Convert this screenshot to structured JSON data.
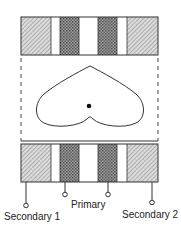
{
  "diagram": {
    "type": "transformer-winding-field-pattern",
    "bars": {
      "top": {
        "x": 21,
        "y": 17,
        "w": 137,
        "h": 38
      },
      "bottom": {
        "x": 21,
        "y": 144,
        "w": 137,
        "h": 38
      },
      "segments": [
        {
          "x0": 21,
          "x1": 51,
          "fill": "light-hatch",
          "role": "secondary"
        },
        {
          "x0": 51,
          "x1": 60,
          "fill": "white",
          "role": "gap"
        },
        {
          "x0": 60,
          "x1": 79,
          "fill": "dark-dots",
          "role": "primary"
        },
        {
          "x0": 79,
          "x1": 98,
          "fill": "white",
          "role": "core"
        },
        {
          "x0": 98,
          "x1": 117,
          "fill": "dark-dots",
          "role": "primary"
        },
        {
          "x0": 117,
          "x1": 127,
          "fill": "white",
          "role": "gap"
        },
        {
          "x0": 127,
          "x1": 158,
          "fill": "light-hatch",
          "role": "secondary"
        }
      ]
    },
    "dashed_guides": {
      "left_x": 21,
      "right_x": 158,
      "y0": 58,
      "y1": 141
    },
    "cardioid": {
      "shape": "heart-pattern",
      "center_dot": {
        "x": 89,
        "y": 106
      }
    },
    "terminals": [
      {
        "id": "secondary-1",
        "x": 26,
        "circle_y": 206
      },
      {
        "id": "primary-a",
        "x": 65,
        "circle_y": 195
      },
      {
        "id": "primary-b",
        "x": 108,
        "circle_y": 195
      },
      {
        "id": "secondary-2",
        "x": 152,
        "circle_y": 203
      }
    ],
    "labels": {
      "secondary_1": "Secondary 1",
      "primary": "Primary",
      "secondary_2": "Secondary 2"
    },
    "colors": {
      "stroke": "#333333",
      "light_hatch_bg": "#d8d8d8",
      "dark_dots_bg": "#8a8a8a"
    }
  }
}
